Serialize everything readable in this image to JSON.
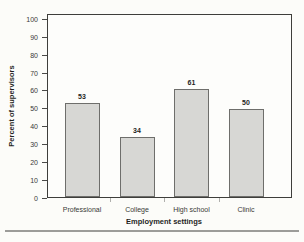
{
  "colors": {
    "background": "#fcfcf9",
    "plot_border": "#3e3e3b",
    "bar_fill": "#d7d7d4",
    "bar_border": "#6e6e6b",
    "tick": "#4a4a48",
    "text": "#2c2c2a",
    "divider": "#9c9c99"
  },
  "chart_data": {
    "type": "bar",
    "categories": [
      "Professional",
      "College",
      "High school",
      "Clinic"
    ],
    "values": [
      53,
      34,
      61,
      50
    ],
    "value_labels": [
      "53",
      "34",
      "61",
      "50"
    ],
    "title": "",
    "xlabel": "Employment settings",
    "ylabel": "Percent of supervisors",
    "ylim": [
      0,
      100
    ],
    "ytick_step": 10,
    "yticks": [
      0,
      10,
      20,
      30,
      40,
      50,
      60,
      70,
      80,
      90,
      100
    ],
    "grid": false,
    "legend": "none"
  }
}
